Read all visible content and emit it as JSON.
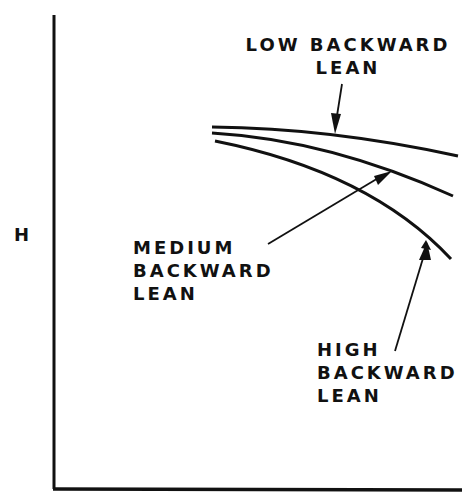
{
  "diagram": {
    "y_axis_label": "H",
    "x_axis_label": "",
    "colors": {
      "ink": "#111111",
      "background": "#ffffff"
    },
    "curves": [
      {
        "name": "low",
        "label_lines": [
          "LOW BACKWARD",
          "LEAN"
        ]
      },
      {
        "name": "medium",
        "label_lines": [
          "MEDIUM",
          "BACKWARD",
          "LEAN"
        ]
      },
      {
        "name": "high",
        "label_lines": [
          "HIGH",
          "BACKWARD",
          "LEAN"
        ]
      }
    ]
  }
}
